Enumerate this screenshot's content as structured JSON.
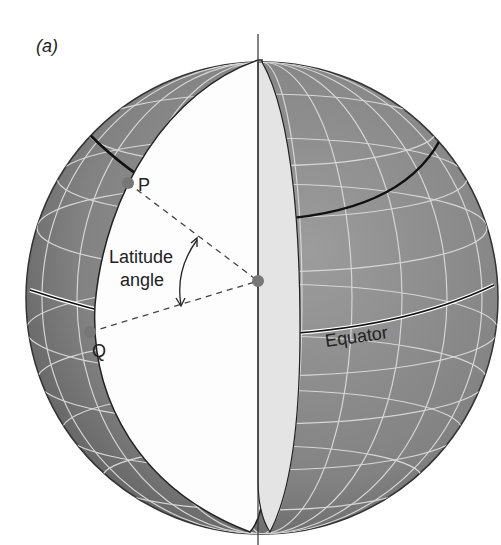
{
  "figure": {
    "panel_label": "(a)",
    "labels": {
      "point_p": "P",
      "point_q": "Q",
      "angle_line1": "Latitude",
      "angle_line2": "angle",
      "equator": "Equator"
    },
    "colors": {
      "globe": "#8a8a8a",
      "globe_dark": "#6a6a6a",
      "grid": "#d8d8d8",
      "cut_face": "#ffffff",
      "cut_edge": "#e6e6e6",
      "point": "#7a7a7a",
      "outline": "#222222"
    }
  }
}
